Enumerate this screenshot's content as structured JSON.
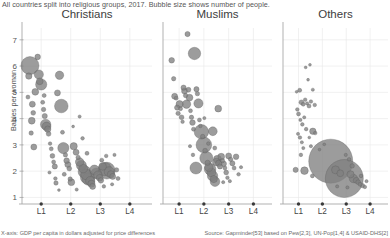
{
  "subtitle": "All countries split into religious groups, 2017. Bubble size shows number of people.",
  "footer": {
    "left": "X-axis: GDP per capita in dollars adjusted for price differences",
    "right": "Source: Gapminder[53] based on Pew[2,3], UN-Pop[1,4] & USAID-DHS[2]"
  },
  "axes": {
    "ylabel": "Babies per woman",
    "yticks": [
      "1",
      "2",
      "3",
      "4",
      "5",
      "6",
      "7"
    ],
    "yvalues": [
      1,
      2,
      3,
      4,
      5,
      6,
      7
    ],
    "ylim": [
      0.75,
      7.45
    ],
    "xticks": [
      "L1",
      "L2",
      "L3",
      "L4"
    ],
    "xvalues": [
      1,
      2,
      3,
      4
    ],
    "xlim": [
      0.35,
      4.75
    ]
  },
  "panels": [
    {
      "label": "Christians"
    },
    {
      "label": "Muslims"
    },
    {
      "label": "Others"
    }
  ],
  "chart_data": {
    "type": "scatter",
    "title": "",
    "subtitle": "All countries split into religious groups, 2017. Bubble size shows number of people.",
    "xlabel": "X-axis: GDP per capita in dollars adjusted for price differences",
    "ylabel": "Babies per woman",
    "xlim": [
      0.35,
      4.75
    ],
    "ylim": [
      0.75,
      7.45
    ],
    "xtick_labels": [
      "L1",
      "L2",
      "L3",
      "L4"
    ],
    "ytick_labels": [
      "1",
      "2",
      "3",
      "4",
      "5",
      "6",
      "7"
    ],
    "grid": true,
    "legend": "none",
    "size_encoding": "Bubble size shows number of people",
    "facets": [
      "Christians",
      "Muslims",
      "Others"
    ],
    "series": [
      {
        "name": "Christians",
        "points": [
          [
            0.62,
            6.02,
            9.0
          ],
          [
            0.58,
            5.62,
            3.2
          ],
          [
            0.55,
            4.82,
            2.0
          ],
          [
            0.7,
            4.55,
            3.0
          ],
          [
            0.73,
            4.22,
            2.4
          ],
          [
            0.68,
            3.92,
            3.4
          ],
          [
            0.66,
            3.45,
            2.2
          ],
          [
            0.75,
            2.92,
            3.0
          ],
          [
            0.8,
            5.02,
            3.4
          ],
          [
            0.88,
            6.35,
            2.8
          ],
          [
            0.92,
            5.68,
            4.6
          ],
          [
            0.95,
            5.42,
            3.4
          ],
          [
            1.0,
            5.3,
            5.6
          ],
          [
            1.05,
            4.62,
            2.0
          ],
          [
            1.08,
            4.35,
            2.2
          ],
          [
            1.12,
            4.1,
            2.6
          ],
          [
            1.15,
            3.78,
            5.2
          ],
          [
            1.18,
            3.7,
            4.4
          ],
          [
            1.22,
            3.6,
            3.2
          ],
          [
            1.25,
            3.42,
            2.4
          ],
          [
            1.1,
            4.88,
            2.0
          ],
          [
            1.3,
            3.05,
            1.8
          ],
          [
            1.34,
            2.85,
            2.0
          ],
          [
            1.38,
            2.58,
            2.4
          ],
          [
            1.42,
            2.35,
            2.0
          ],
          [
            1.46,
            2.18,
            2.6
          ],
          [
            1.28,
            1.95,
            1.6
          ],
          [
            1.48,
            1.72,
            1.8
          ],
          [
            1.5,
            1.55,
            2.2
          ],
          [
            1.55,
            4.98,
            3.0
          ],
          [
            1.62,
            5.65,
            4.2
          ],
          [
            1.68,
            4.48,
            6.8
          ],
          [
            1.72,
            3.48,
            2.0
          ],
          [
            1.75,
            2.88,
            5.6
          ],
          [
            1.82,
            2.62,
            2.2
          ],
          [
            1.86,
            2.4,
            2.8
          ],
          [
            1.9,
            2.25,
            3.0
          ],
          [
            1.95,
            2.1,
            2.4
          ],
          [
            1.78,
            1.88,
            2.0
          ],
          [
            1.98,
            1.7,
            2.2
          ],
          [
            2.02,
            1.58,
            3.4
          ],
          [
            2.1,
            2.95,
            3.6
          ],
          [
            2.18,
            2.72,
            3.0
          ],
          [
            2.25,
            2.52,
            2.2
          ],
          [
            2.3,
            2.35,
            4.2
          ],
          [
            2.36,
            2.22,
            5.0
          ],
          [
            2.42,
            2.1,
            4.4
          ],
          [
            2.46,
            1.98,
            6.2
          ],
          [
            2.52,
            1.88,
            5.4
          ],
          [
            2.56,
            1.78,
            7.0
          ],
          [
            2.6,
            1.7,
            6.2
          ],
          [
            2.66,
            1.62,
            4.6
          ],
          [
            2.7,
            1.52,
            3.6
          ],
          [
            2.74,
            1.42,
            3.0
          ],
          [
            2.3,
            4.08,
            1.6
          ],
          [
            2.4,
            3.25,
            1.8
          ],
          [
            2.55,
            2.68,
            2.0
          ],
          [
            2.8,
            2.05,
            4.8
          ],
          [
            2.86,
            1.92,
            5.2
          ],
          [
            2.92,
            1.85,
            4.2
          ],
          [
            2.98,
            1.75,
            3.4
          ],
          [
            3.02,
            1.65,
            2.8
          ],
          [
            3.08,
            2.18,
            3.8
          ],
          [
            3.15,
            2.08,
            6.6
          ],
          [
            3.22,
            2.02,
            8.4
          ],
          [
            3.3,
            1.98,
            5.0
          ],
          [
            3.36,
            1.88,
            3.6
          ],
          [
            3.42,
            1.8,
            3.0
          ],
          [
            3.05,
            2.42,
            2.0
          ],
          [
            3.2,
            2.58,
            1.8
          ],
          [
            3.48,
            2.62,
            1.6
          ],
          [
            3.55,
            2.05,
            2.2
          ],
          [
            3.6,
            1.72,
            2.0
          ],
          [
            3.12,
            1.42,
            1.8
          ],
          [
            2.2,
            1.3,
            1.6
          ],
          [
            1.6,
            1.28,
            1.4
          ],
          [
            3.4,
            1.5,
            1.6
          ],
          [
            2.08,
            3.7,
            1.4
          ]
        ]
      },
      {
        "name": "Muslims",
        "points": [
          [
            0.7,
            6.22,
            2.8
          ],
          [
            0.78,
            5.52,
            2.2
          ],
          [
            0.82,
            4.85,
            3.0
          ],
          [
            0.88,
            4.78,
            2.0
          ],
          [
            0.92,
            4.42,
            2.6
          ],
          [
            0.96,
            4.2,
            2.2
          ],
          [
            1.02,
            4.55,
            3.6
          ],
          [
            1.06,
            4.38,
            2.0
          ],
          [
            1.1,
            4.05,
            2.4
          ],
          [
            1.14,
            3.88,
            1.8
          ],
          [
            1.18,
            5.18,
            2.6
          ],
          [
            1.22,
            5.05,
            3.0
          ],
          [
            1.26,
            4.88,
            2.2
          ],
          [
            1.3,
            4.55,
            4.2
          ],
          [
            1.34,
            7.22,
            2.6
          ],
          [
            1.38,
            5.1,
            2.4
          ],
          [
            1.42,
            4.8,
            3.4
          ],
          [
            1.46,
            4.3,
            2.0
          ],
          [
            1.5,
            4.05,
            2.2
          ],
          [
            1.54,
            3.85,
            2.8
          ],
          [
            1.58,
            3.6,
            2.0
          ],
          [
            1.62,
            6.48,
            6.2
          ],
          [
            1.7,
            5.12,
            2.6
          ],
          [
            1.74,
            4.95,
            2.2
          ],
          [
            1.78,
            4.58,
            4.6
          ],
          [
            1.82,
            3.95,
            2.0
          ],
          [
            1.86,
            3.72,
            1.8
          ],
          [
            1.9,
            3.5,
            7.2
          ],
          [
            1.95,
            3.32,
            2.2
          ],
          [
            2.0,
            3.0,
            7.8
          ],
          [
            2.05,
            2.78,
            2.4
          ],
          [
            2.1,
            2.5,
            6.6
          ],
          [
            2.15,
            2.32,
            2.6
          ],
          [
            2.2,
            2.15,
            4.2
          ],
          [
            2.25,
            2.08,
            5.8
          ],
          [
            2.3,
            1.95,
            4.4
          ],
          [
            2.35,
            1.82,
            5.2
          ],
          [
            2.4,
            1.7,
            3.6
          ],
          [
            2.45,
            1.6,
            4.8
          ],
          [
            1.68,
            2.12,
            6.0
          ],
          [
            2.5,
            2.35,
            3.8
          ],
          [
            2.55,
            2.45,
            4.0
          ],
          [
            2.6,
            2.3,
            3.2
          ],
          [
            2.65,
            2.18,
            2.6
          ],
          [
            2.7,
            2.55,
            3.4
          ],
          [
            2.75,
            2.4,
            2.2
          ],
          [
            2.8,
            2.28,
            2.8
          ],
          [
            2.85,
            2.12,
            2.0
          ],
          [
            2.9,
            1.95,
            2.4
          ],
          [
            2.58,
            4.38,
            3.4
          ],
          [
            2.36,
            3.52,
            4.4
          ],
          [
            2.44,
            2.88,
            2.0
          ],
          [
            3.0,
            2.58,
            3.0
          ],
          [
            3.08,
            2.45,
            2.2
          ],
          [
            3.15,
            2.3,
            2.6
          ],
          [
            3.22,
            2.12,
            2.0
          ],
          [
            3.3,
            2.55,
            2.8
          ],
          [
            2.95,
            1.75,
            1.8
          ],
          [
            3.05,
            1.62,
            1.6
          ],
          [
            3.4,
            1.88,
            1.8
          ],
          [
            1.44,
            2.95,
            1.6
          ],
          [
            1.56,
            2.62,
            1.8
          ],
          [
            2.02,
            4.02,
            1.6
          ],
          [
            2.18,
            3.05,
            1.8
          ],
          [
            3.5,
            2.15,
            1.6
          ],
          [
            2.78,
            1.58,
            1.6
          ]
        ]
      },
      {
        "name": "Others",
        "points": [
          [
            1.05,
            5.08,
            2.0
          ],
          [
            1.12,
            4.62,
            2.4
          ],
          [
            1.2,
            4.55,
            2.0
          ],
          [
            1.28,
            4.72,
            1.8
          ],
          [
            1.36,
            4.58,
            1.6
          ],
          [
            1.44,
            4.48,
            2.0
          ],
          [
            1.52,
            4.65,
            1.8
          ],
          [
            1.6,
            5.1,
            1.6
          ],
          [
            1.68,
            4.52,
            1.8
          ],
          [
            0.95,
            4.35,
            1.8
          ],
          [
            1.0,
            4.18,
            2.0
          ],
          [
            1.08,
            3.95,
            1.6
          ],
          [
            1.16,
            3.78,
            1.8
          ],
          [
            1.24,
            4.05,
            1.6
          ],
          [
            1.32,
            3.6,
            1.8
          ],
          [
            0.98,
            3.42,
            1.6
          ],
          [
            1.06,
            3.28,
            1.8
          ],
          [
            1.14,
            3.1,
            1.6
          ],
          [
            1.3,
            5.95,
            1.4
          ],
          [
            1.48,
            6.05,
            1.4
          ],
          [
            1.2,
            2.88,
            1.6
          ],
          [
            1.1,
            2.62,
            1.8
          ],
          [
            1.6,
            3.52,
            3.2
          ],
          [
            1.7,
            3.45,
            1.8
          ],
          [
            1.52,
            2.95,
            1.6
          ],
          [
            0.88,
            2.05,
            2.6
          ],
          [
            1.25,
            2.02,
            3.8
          ],
          [
            1.58,
            1.82,
            2.0
          ],
          [
            2.35,
            2.38,
            22.0
          ],
          [
            2.92,
            1.72,
            19.0
          ],
          [
            2.55,
            2.05,
            4.0
          ],
          [
            2.75,
            1.92,
            3.4
          ],
          [
            3.18,
            1.88,
            3.6
          ],
          [
            3.3,
            1.72,
            4.2
          ],
          [
            3.42,
            1.65,
            3.0
          ],
          [
            3.5,
            1.58,
            2.4
          ],
          [
            3.58,
            1.5,
            2.0
          ],
          [
            3.68,
            1.45,
            2.2
          ],
          [
            3.78,
            1.4,
            1.8
          ],
          [
            3.25,
            2.2,
            2.2
          ],
          [
            3.12,
            2.45,
            1.8
          ],
          [
            2.98,
            2.62,
            1.6
          ],
          [
            3.05,
            1.38,
            1.6
          ],
          [
            3.62,
            1.82,
            1.8
          ],
          [
            2.62,
            1.42,
            1.6
          ],
          [
            1.88,
            2.82,
            1.4
          ],
          [
            2.08,
            3.02,
            1.4
          ],
          [
            3.85,
            1.62,
            1.6
          ],
          [
            1.4,
            5.48,
            1.4
          ],
          [
            0.92,
            5.02,
            1.4
          ],
          [
            1.45,
            3.28,
            1.4
          ]
        ]
      }
    ]
  }
}
